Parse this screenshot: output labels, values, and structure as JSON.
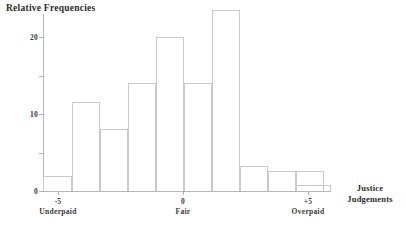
{
  "chart_data": {
    "type": "bar",
    "title": "",
    "ylabel": "Relative Frequencies",
    "xlabel": "Justice Judgements",
    "xlabel_line1": "Justice",
    "xlabel_line2": "Judgements",
    "grid": false,
    "legend": "none",
    "ylim": [
      0,
      25
    ],
    "yticks": [
      0,
      10,
      20
    ],
    "ytick_labels": [
      "0",
      "10",
      "20"
    ],
    "yminor_ticks": [
      5,
      15
    ],
    "xlim": [
      -6,
      5.5
    ],
    "xticks": [
      -5,
      0,
      5
    ],
    "xtick_labels": [
      "-5",
      "0",
      "+5"
    ],
    "xtick_sublabels": [
      "Underpaid",
      "Fair",
      "Overpaid"
    ],
    "categories": [
      "-6",
      "-5",
      "-4",
      "-3",
      "-2",
      "-1",
      "0",
      "1",
      "2",
      "3",
      "4"
    ],
    "values": [
      2,
      11.5,
      8,
      14,
      20,
      14,
      23.5,
      3.2,
      2.6,
      2.6,
      0.8
    ],
    "bar_color": "#ffffff",
    "bar_edge_color": "#c9c9c9",
    "axis_color": "#b8b8b8",
    "text_color": "#2b2b2b"
  },
  "bars": [
    {
      "label": "-6",
      "value": 2,
      "left": 43,
      "width": 29
    },
    {
      "label": "-5",
      "value": 11.5,
      "left": 72,
      "width": 28
    },
    {
      "label": "-4",
      "value": 8,
      "left": 100,
      "width": 28
    },
    {
      "label": "-3",
      "value": 14,
      "left": 128,
      "width": 28
    },
    {
      "label": "-2",
      "value": 20,
      "left": 156,
      "width": 28
    },
    {
      "label": "-1",
      "value": 14,
      "left": 184,
      "width": 28
    },
    {
      "label": "0",
      "value": 23.5,
      "left": 212,
      "width": 28
    },
    {
      "label": "1",
      "value": 3.2,
      "left": 240,
      "width": 28
    },
    {
      "label": "2",
      "value": 2.6,
      "left": 268,
      "width": 28
    },
    {
      "label": "3",
      "value": 2.6,
      "left": 296,
      "width": 28
    },
    {
      "label": "4",
      "value": 0.8,
      "left": 296,
      "width": 35
    }
  ],
  "axes": {
    "y_title": "Relative Frequencies",
    "x_title_line1": "Justice",
    "x_title_line2": "Judgements",
    "y_ticks": [
      {
        "value": 20,
        "label": "20"
      },
      {
        "value": 15,
        "label": ""
      },
      {
        "value": 10,
        "label": "10"
      },
      {
        "value": 5,
        "label": ""
      },
      {
        "value": 0,
        "label": "0"
      }
    ],
    "x_ticks": [
      {
        "value": -5,
        "label": "-5",
        "sublabel": "Underpaid"
      },
      {
        "value": 0,
        "label": "0",
        "sublabel": "Fair"
      },
      {
        "value": 5,
        "label": "+5",
        "sublabel": "Overpaid"
      }
    ]
  }
}
